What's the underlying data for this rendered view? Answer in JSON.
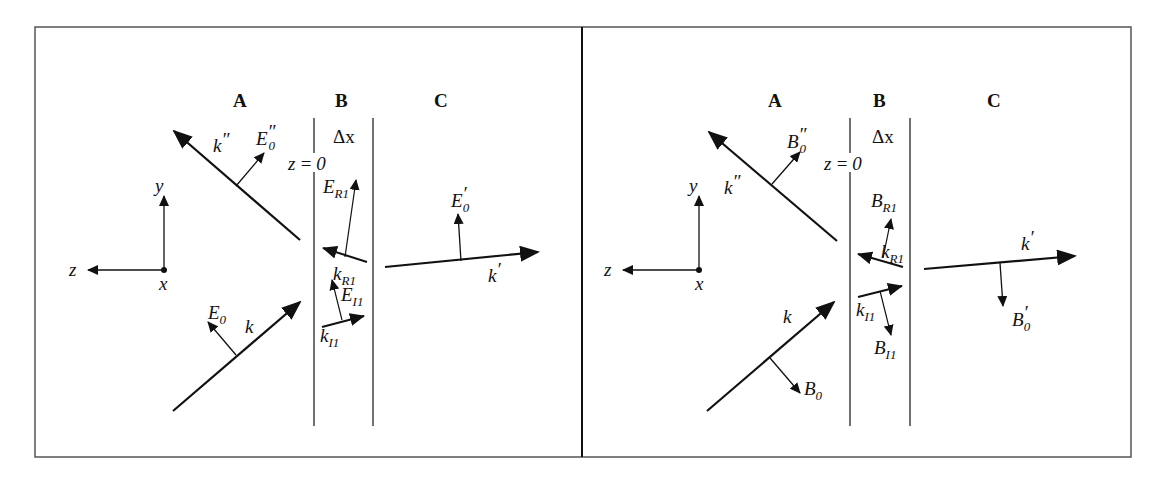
{
  "figure": {
    "panels": [
      {
        "id": "electric",
        "regions": [
          "A",
          "B",
          "C"
        ],
        "layer_thickness": "Δx",
        "interface": "z = 0",
        "axes": {
          "y": "y",
          "z": "z",
          "x": "x"
        },
        "vectors": [
          {
            "name": "k''",
            "role": "reflected wave vector"
          },
          {
            "name": "E''0",
            "role": "reflected E field"
          },
          {
            "name": "k",
            "role": "incident wave vector"
          },
          {
            "name": "E0",
            "role": "incident E field"
          },
          {
            "name": "kR1",
            "role": "reflected in layer"
          },
          {
            "name": "ER1",
            "role": "reflected E in layer"
          },
          {
            "name": "kI1",
            "role": "incident in layer"
          },
          {
            "name": "EI1",
            "role": "incident E in layer"
          },
          {
            "name": "k'",
            "role": "transmitted wave vector"
          },
          {
            "name": "E'0",
            "role": "transmitted E field"
          }
        ]
      },
      {
        "id": "magnetic",
        "regions": [
          "A",
          "B",
          "C"
        ],
        "layer_thickness": "Δx",
        "interface": "z = 0",
        "axes": {
          "y": "y",
          "z": "z",
          "x": "x"
        },
        "vectors": [
          {
            "name": "k''",
            "role": "reflected wave vector"
          },
          {
            "name": "B''0",
            "role": "reflected B field"
          },
          {
            "name": "k",
            "role": "incident wave vector"
          },
          {
            "name": "B0",
            "role": "incident B field"
          },
          {
            "name": "kR1",
            "role": "reflected in layer"
          },
          {
            "name": "BR1",
            "role": "reflected B in layer"
          },
          {
            "name": "kI1",
            "role": "incident in layer"
          },
          {
            "name": "BI1",
            "role": "incident B in layer"
          },
          {
            "name": "k'",
            "role": "transmitted wave vector"
          },
          {
            "name": "B'0",
            "role": "transmitted B field"
          }
        ]
      }
    ],
    "labels": {
      "A": "A",
      "B": "B",
      "C": "C",
      "dx": "Δx",
      "z0_lhs": "z",
      "z0_eq": "=",
      "z0_rhs": "0",
      "ax_y": "y",
      "ax_z": "z",
      "ax_x": "x",
      "k": "k",
      "kpp": "k",
      "kp": "k",
      "prime": "′",
      "dprime": "″",
      "E": "E",
      "sub0": "0",
      "subR1": "R1",
      "subI1": "I1",
      "kR": "k",
      "kI": "k"
    },
    "colors": {
      "ink": "#111111",
      "frame": "#555555",
      "background": "#ffffff"
    }
  }
}
